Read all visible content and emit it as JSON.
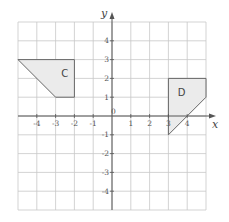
{
  "axes": {
    "x_label": "x",
    "y_label": "y",
    "origin_label": "0",
    "x_ticks": [
      {
        "v": -4,
        "label": "-4"
      },
      {
        "v": -3,
        "label": "-3"
      },
      {
        "v": -2,
        "label": "-2"
      },
      {
        "v": -1,
        "label": "-1"
      },
      {
        "v": 1,
        "label": "1"
      },
      {
        "v": 2,
        "label": "2"
      },
      {
        "v": 3,
        "label": "3"
      },
      {
        "v": 4,
        "label": "4"
      }
    ],
    "y_ticks": [
      {
        "v": 4,
        "label": "4"
      },
      {
        "v": 3,
        "label": "3"
      },
      {
        "v": 2,
        "label": "2"
      },
      {
        "v": 1,
        "label": "1"
      },
      {
        "v": -1,
        "label": "-1"
      },
      {
        "v": -2,
        "label": "-2"
      },
      {
        "v": -3,
        "label": "-3"
      },
      {
        "v": -4,
        "label": "-4"
      }
    ],
    "range": {
      "xmin": -5,
      "xmax": 5,
      "ymin": -5,
      "ymax": 5
    }
  },
  "shapes": [
    {
      "name": "C",
      "label": "C",
      "points": [
        [
          -5,
          3
        ],
        [
          -2,
          3
        ],
        [
          -2,
          1
        ],
        [
          -3,
          1
        ]
      ],
      "label_pos": [
        -2.7,
        2.3
      ]
    },
    {
      "name": "D",
      "label": "D",
      "points": [
        [
          3,
          2
        ],
        [
          5,
          2
        ],
        [
          5,
          1
        ],
        [
          3,
          -1
        ]
      ],
      "label_pos": [
        3.5,
        1.3
      ]
    }
  ],
  "colors": {
    "grid": "#c8c8c8",
    "axis": "#555555",
    "shape_fill": "#ebebeb",
    "shape_stroke": "#666666"
  }
}
